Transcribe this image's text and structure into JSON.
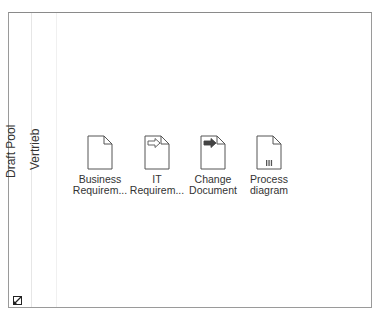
{
  "pool": {
    "label": "Draft Pool"
  },
  "lane": {
    "label": "Vertrieb"
  },
  "documents": [
    {
      "label_line1": "Business",
      "label_line2": "Requirem...",
      "icon": "document-blank-icon"
    },
    {
      "label_line1": "IT",
      "label_line2": "Requirem...",
      "icon": "document-outline-arrow-icon"
    },
    {
      "label_line1": "Change",
      "label_line2": "Document",
      "icon": "document-filled-arrow-icon"
    },
    {
      "label_line1": "Process",
      "label_line2": "diagram",
      "icon": "document-bars-icon"
    }
  ],
  "corner": {
    "icon": "resize-collapse-icon"
  },
  "colors": {
    "border": "#9a9a9a",
    "icon_stroke": "#555555",
    "text": "#333333"
  }
}
